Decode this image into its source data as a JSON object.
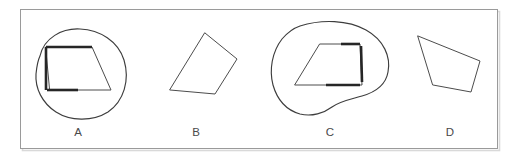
{
  "figure": {
    "caption_labels": [
      "A",
      "B",
      "C",
      "D"
    ],
    "background_color": "#ffffff",
    "frame_border_color": "#9a9a9a",
    "shape_stroke_color": "#4c4c4c",
    "highlight_stroke_color": "#262626",
    "annotation_circle_color": "#3d3d3d",
    "label_color": "#4a4a4a",
    "panels": [
      {
        "id": "panel-a",
        "label": "A",
        "label_x": 78,
        "label_y": 136,
        "has_annotation_circle": true,
        "quadrilateral": "46,47 92,47 111,90 50,90",
        "highlighted_edges": [
          "46,47 92,47",
          "46,47 46,90",
          "47,90 78,90"
        ],
        "annotation_circle_path": "M 40,56 C 44,38 62,28 80,29 C 100,30 118,41 124,60 C 130,80 124,101 108,112 C 92,122 70,121 56,112 C 42,103 35,88 36,74 C 37,64 38,60 40,56 Z"
      },
      {
        "id": "panel-b",
        "label": "B",
        "label_x": 196,
        "label_y": 136,
        "has_annotation_circle": false,
        "quadrilateral": "205,33 237,59 215,94 170,90",
        "highlighted_edges": [],
        "annotation_circle_path": ""
      },
      {
        "id": "panel-c",
        "label": "C",
        "label_x": 330,
        "label_y": 136,
        "has_annotation_circle": true,
        "quadrilateral": "320,44 360,44 362,85 295,85",
        "highlighted_edges": [
          "341,44 360,44",
          "361,46 362,82",
          "326,85 360,85"
        ],
        "annotation_circle_path": "M 300,26 C 322,19 348,20 366,30 C 384,40 391,57 388,72 C 386,84 376,92 362,96 C 352,99 340,101 332,107 C 324,113 312,117 300,114 C 286,110 277,99 273,85 C 269,70 272,52 282,39 C 288,32 294,28 300,26 Z"
      },
      {
        "id": "panel-d",
        "label": "D",
        "label_x": 450,
        "label_y": 136,
        "has_annotation_circle": false,
        "quadrilateral": "418,36 480,61 471,92 433,85",
        "highlighted_edges": [],
        "annotation_circle_path": ""
      }
    ],
    "frame": {
      "x": 20,
      "y": 9,
      "width": 477,
      "height": 139
    }
  }
}
